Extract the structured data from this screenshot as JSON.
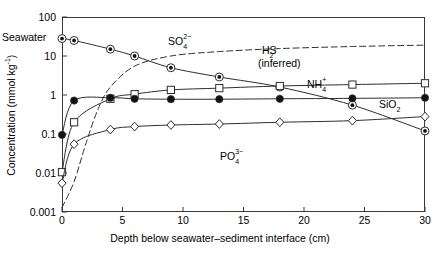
{
  "figure": {
    "seawater_label": "Seawater",
    "y_axis_title_main": "Concentration (mmol kg",
    "y_axis_title_sup": "-1",
    "y_axis_title_end": ")",
    "x_axis_title": "Depth below seawater–sediment interface (cm)"
  },
  "chart_data": {
    "type": "line",
    "title": "",
    "xlabel": "Depth below seawater–sediment interface (cm)",
    "ylabel": "Concentration (mmol kg⁻¹)",
    "yscale": "log",
    "xlim": [
      0,
      30
    ],
    "ylim": [
      0.001,
      100
    ],
    "grid": false,
    "legend": "inline-annotations",
    "xticks": [
      0,
      5,
      10,
      15,
      20,
      25,
      30
    ],
    "xtick_labels": [
      "0",
      "5",
      "10",
      "15",
      "20",
      "25",
      "30"
    ],
    "yticks": [
      0.001,
      0.01,
      0.1,
      1,
      10,
      100
    ],
    "ytick_labels": [
      "0.001",
      "0.01",
      "0.1",
      "1",
      "10",
      "100"
    ],
    "series": [
      {
        "name": "SO4",
        "label_main": "SO",
        "label_sub": "4",
        "label_sup": "2−",
        "marker": "circle-dot",
        "linestyle": "solid",
        "x": [
          0,
          1,
          4,
          6,
          9,
          13,
          18,
          24,
          30
        ],
        "values": [
          28,
          25,
          15,
          10,
          5,
          2.9,
          1.6,
          0.55,
          0.12
        ],
        "label_pos": {
          "x": 168,
          "y": 36
        }
      },
      {
        "name": "H2S (inferred)",
        "label_main": "H",
        "label_sub": "2",
        "label_main2": "S",
        "label_note": "(inferred)",
        "marker": "none",
        "linestyle": "dashed",
        "x": [
          0,
          1,
          2,
          3,
          4,
          6,
          9,
          13,
          18,
          24,
          30
        ],
        "values": [
          0.0013,
          0.006,
          0.06,
          0.45,
          1.6,
          5.5,
          10,
          13,
          15.5,
          17.5,
          19
        ],
        "label_pos": {
          "x": 262,
          "y": 45
        },
        "note_pos": {
          "x": 258,
          "y": 58
        }
      },
      {
        "name": "NH4",
        "label_main": "NH",
        "label_sub": "4",
        "label_sup": "+",
        "marker": "square-open",
        "linestyle": "solid",
        "x": [
          0,
          1,
          4,
          6,
          9,
          13,
          18,
          24,
          30
        ],
        "values": [
          0.0105,
          0.2,
          0.8,
          1.05,
          1.35,
          1.5,
          1.7,
          1.85,
          2.0
        ],
        "label_pos": {
          "x": 307,
          "y": 79
        }
      },
      {
        "name": "SiO2",
        "label_main": "SiO",
        "label_sub": "2",
        "marker": "circle-filled",
        "linestyle": "solid",
        "x": [
          0,
          1,
          4,
          6,
          9,
          13,
          18,
          24,
          30
        ],
        "values": [
          0.095,
          0.72,
          0.85,
          0.8,
          0.78,
          0.78,
          0.8,
          0.82,
          0.85
        ],
        "label_pos": {
          "x": 379,
          "y": 99
        }
      },
      {
        "name": "PO4",
        "label_main": "PO",
        "label_sub": "4",
        "label_sup": "3−",
        "marker": "diamond-open",
        "linestyle": "solid",
        "x": [
          0,
          1,
          4,
          6,
          9,
          13,
          18,
          24,
          30
        ],
        "values": [
          0.0055,
          0.055,
          0.13,
          0.155,
          0.17,
          0.18,
          0.2,
          0.22,
          0.28
        ],
        "label_pos": {
          "x": 220,
          "y": 151
        }
      }
    ]
  }
}
